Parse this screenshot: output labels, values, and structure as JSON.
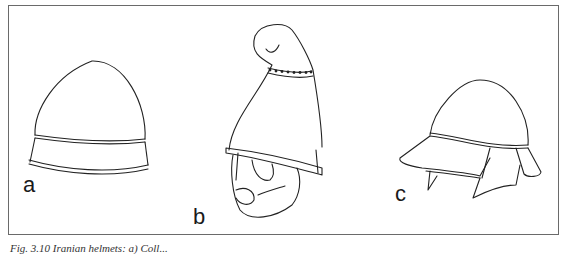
{
  "figure": {
    "panels": [
      {
        "id": "a",
        "label": "a",
        "description": "conical helmet with brim band"
      },
      {
        "id": "b",
        "label": "b",
        "description": "pointed curled-crest helmet on bearded head, dotted band"
      },
      {
        "id": "c",
        "label": "c",
        "description": "rounded helmet with peak and cheek/neck guards"
      }
    ],
    "caption": "Fig. 3.10   Iranian helmets: a) Coll..."
  }
}
